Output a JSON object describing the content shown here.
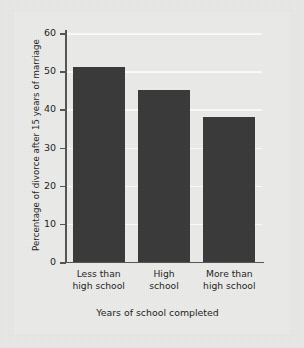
{
  "chart_data": {
    "type": "bar",
    "title": "",
    "xlabel": "Years of school completed",
    "ylabel": "Percentage of divorce after 15 years of marriage",
    "categories": [
      "Less than high school",
      "High school",
      "More than high school"
    ],
    "category_lines": [
      [
        "Less than",
        "high school"
      ],
      [
        "High",
        "school"
      ],
      [
        "More than",
        "high school"
      ]
    ],
    "values": [
      51,
      45,
      38
    ],
    "ylim": [
      0,
      60
    ],
    "ytick_labels": [
      "60",
      "50",
      "40",
      "30",
      "20",
      "10",
      "0"
    ],
    "ytick_values": [
      60,
      50,
      40,
      30,
      20,
      10,
      0
    ],
    "grid": true,
    "grid_axis": "y",
    "legend": false,
    "bar_color": "#3a3a3a",
    "gridline_color": "#fbfbfa",
    "axis_color": "#555553",
    "plot_background": "#ebebe9",
    "figure_background": "#e8e8e6"
  }
}
